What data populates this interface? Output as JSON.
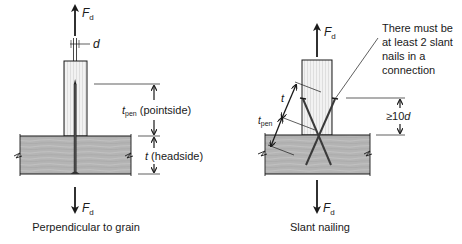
{
  "colors": {
    "ink": "#1a1a1a",
    "beam_fill": "#b4b4b4",
    "post_fill": "#f2f2f2",
    "grain_line": "#d0d0d0",
    "background": "#ffffff"
  },
  "left_panel": {
    "caption": "Perpendicular to grain",
    "force_top": {
      "symbol": "F",
      "subscript": "d"
    },
    "force_bottom": {
      "symbol": "F",
      "subscript": "d"
    },
    "diameter_label": "d",
    "dim_pointside": {
      "symbol": "t",
      "subscript": "pen",
      "text": " (pointside)"
    },
    "dim_headside": {
      "symbol": "t",
      "text": " (headside)"
    }
  },
  "right_panel": {
    "caption": "Slant nailing",
    "force_top": {
      "symbol": "F",
      "subscript": "d"
    },
    "force_bottom": {
      "symbol": "F",
      "subscript": "d"
    },
    "dim_t": {
      "symbol": "t"
    },
    "dim_tpen": {
      "symbol": "t",
      "subscript": "pen"
    },
    "dim_spacing": {
      "prefix": "≥10",
      "symbol": "d"
    },
    "note_lines": [
      "There must be",
      "at least 2 slant",
      "nails in a",
      "connection"
    ]
  }
}
